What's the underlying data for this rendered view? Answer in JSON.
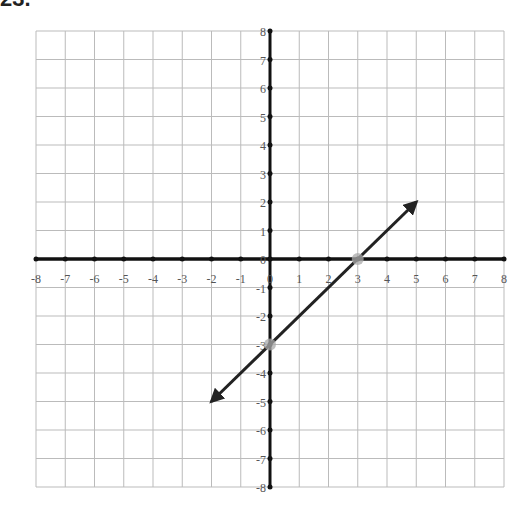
{
  "problem": {
    "label": "23."
  },
  "chart_data": {
    "type": "line",
    "title": "",
    "xlabel": "",
    "ylabel": "",
    "xlim": [
      -8,
      8
    ],
    "ylim": [
      -8,
      8
    ],
    "grid": true,
    "x_ticks": [
      -8,
      -7,
      -6,
      -5,
      -4,
      -3,
      -2,
      -1,
      0,
      1,
      2,
      3,
      4,
      5,
      6,
      7,
      8
    ],
    "y_ticks": [
      -8,
      -7,
      -6,
      -5,
      -4,
      -3,
      -2,
      -1,
      0,
      1,
      2,
      3,
      4,
      5,
      6,
      7,
      8
    ],
    "series": [
      {
        "name": "line",
        "x": [
          -2,
          5
        ],
        "y": [
          -5,
          2
        ],
        "arrows": "both",
        "color": "#222222"
      }
    ],
    "highlighted_points": [
      {
        "x": 0,
        "y": -3,
        "label": "y-intercept"
      },
      {
        "x": 3,
        "y": 0,
        "label": "x-intercept"
      }
    ],
    "highlight_color": "#aaaaaa"
  },
  "layout": {
    "grid_left": 36,
    "grid_top": 31,
    "grid_right": 504,
    "grid_bottom": 487,
    "grid_color": "#bbbbbb",
    "axis_color": "#111111"
  }
}
